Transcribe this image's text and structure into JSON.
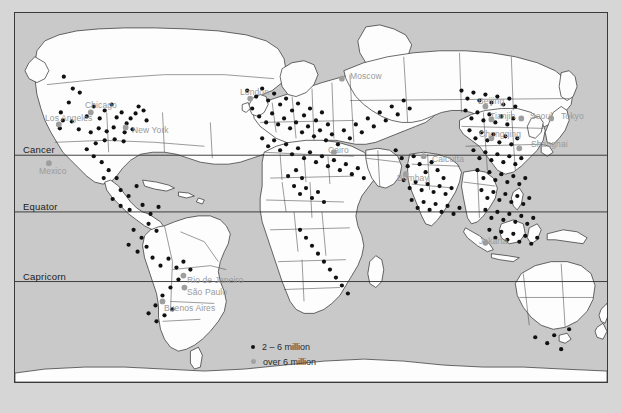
{
  "map": {
    "title": "World map of large cities",
    "background_color": "#c9c9c9",
    "land_color": "#fdfdfd",
    "border_color": "#2b2b2b",
    "page_color": "#d6d6d6"
  },
  "latitude_lines": [
    {
      "name": "cancer",
      "label": "Cancer",
      "y": 155
    },
    {
      "name": "equator",
      "label": "Equator",
      "y": 212
    },
    {
      "name": "capricorn",
      "label": "Capricorn",
      "y": 282
    }
  ],
  "legend": {
    "items": [
      {
        "name": "legend-2-6-million",
        "label": "2 – 6 million",
        "marker": "small-black-dot",
        "color": "#141414"
      },
      {
        "name": "legend-over-6-million",
        "label": "over 6 million",
        "marker": "large-gray-dot",
        "color": "#a2a2a2"
      }
    ]
  },
  "city_labels": [
    {
      "name": "los-angeles",
      "label": "Los Angeles",
      "x": 44,
      "y": 118
    },
    {
      "name": "chicago",
      "label": "Chicago",
      "x": 84,
      "y": 105
    },
    {
      "name": "new-york",
      "label": "New York",
      "x": 131,
      "y": 130
    },
    {
      "name": "mexico",
      "label": "Mexico",
      "x": 38,
      "y": 171
    },
    {
      "name": "rio-de-janeiro",
      "label": "Rio de Janeiro",
      "x": 186,
      "y": 280
    },
    {
      "name": "sao-paulo",
      "label": "São Paulo",
      "x": 186,
      "y": 292
    },
    {
      "name": "buenos-aires",
      "label": "Buenos Aires",
      "x": 163,
      "y": 308
    },
    {
      "name": "london",
      "label": "London",
      "x": 239,
      "y": 92
    },
    {
      "name": "moscow",
      "label": "Moscow",
      "x": 349,
      "y": 76
    },
    {
      "name": "cairo",
      "label": "Cairo",
      "x": 327,
      "y": 150
    },
    {
      "name": "bombay",
      "label": "Bombay",
      "x": 396,
      "y": 178
    },
    {
      "name": "calcutta",
      "label": "Calcutta",
      "x": 431,
      "y": 159
    },
    {
      "name": "beijing",
      "label": "Beijing",
      "x": 477,
      "y": 101
    },
    {
      "name": "tianjin",
      "label": "Tianjin",
      "x": 489,
      "y": 116
    },
    {
      "name": "seoul",
      "label": "Seoul",
      "x": 529,
      "y": 116
    },
    {
      "name": "tokyo",
      "label": "Tokyo",
      "x": 560,
      "y": 116
    },
    {
      "name": "chongqing",
      "label": "Chongqing",
      "x": 478,
      "y": 134
    },
    {
      "name": "shanghai",
      "label": "Shanghai",
      "x": 530,
      "y": 144
    },
    {
      "name": "jakarta",
      "label": "Jakarta",
      "x": 478,
      "y": 241
    }
  ],
  "city_dots": {
    "small": [
      [
        63,
        76
      ],
      [
        72,
        88
      ],
      [
        79,
        92
      ],
      [
        68,
        102
      ],
      [
        60,
        112
      ],
      [
        62,
        120
      ],
      [
        59,
        128
      ],
      [
        71,
        121
      ],
      [
        78,
        129
      ],
      [
        86,
        116
      ],
      [
        93,
        106
      ],
      [
        99,
        118
      ],
      [
        104,
        110
      ],
      [
        111,
        104
      ],
      [
        116,
        117
      ],
      [
        121,
        112
      ],
      [
        126,
        123
      ],
      [
        130,
        118
      ],
      [
        135,
        113
      ],
      [
        138,
        106
      ],
      [
        143,
        110
      ],
      [
        146,
        120
      ],
      [
        124,
        132
      ],
      [
        132,
        129
      ],
      [
        113,
        127
      ],
      [
        106,
        131
      ],
      [
        98,
        128
      ],
      [
        90,
        132
      ],
      [
        95,
        143
      ],
      [
        104,
        140
      ],
      [
        114,
        139
      ],
      [
        123,
        141
      ],
      [
        86,
        149
      ],
      [
        93,
        156
      ],
      [
        101,
        162
      ],
      [
        108,
        170
      ],
      [
        116,
        178
      ],
      [
        103,
        178
      ],
      [
        120,
        190
      ],
      [
        128,
        196
      ],
      [
        136,
        186
      ],
      [
        112,
        199
      ],
      [
        120,
        206
      ],
      [
        129,
        210
      ],
      [
        142,
        205
      ],
      [
        150,
        214
      ],
      [
        158,
        207
      ],
      [
        148,
        224
      ],
      [
        156,
        231
      ],
      [
        141,
        238
      ],
      [
        133,
        230
      ],
      [
        128,
        245
      ],
      [
        137,
        252
      ],
      [
        146,
        247
      ],
      [
        152,
        258
      ],
      [
        160,
        266
      ],
      [
        168,
        259
      ],
      [
        176,
        268
      ],
      [
        183,
        262
      ],
      [
        190,
        270
      ],
      [
        178,
        280
      ],
      [
        170,
        288
      ],
      [
        162,
        296
      ],
      [
        155,
        306
      ],
      [
        148,
        314
      ],
      [
        156,
        322
      ],
      [
        164,
        316
      ],
      [
        172,
        310
      ],
      [
        247,
        90
      ],
      [
        256,
        96
      ],
      [
        262,
        88
      ],
      [
        268,
        100
      ],
      [
        274,
        93
      ],
      [
        280,
        104
      ],
      [
        286,
        98
      ],
      [
        292,
        110
      ],
      [
        298,
        103
      ],
      [
        304,
        115
      ],
      [
        310,
        108
      ],
      [
        316,
        120
      ],
      [
        322,
        112
      ],
      [
        328,
        124
      ],
      [
        252,
        108
      ],
      [
        259,
        116
      ],
      [
        266,
        122
      ],
      [
        272,
        113
      ],
      [
        278,
        124
      ],
      [
        284,
        118
      ],
      [
        290,
        128
      ],
      [
        296,
        122
      ],
      [
        302,
        132
      ],
      [
        308,
        126
      ],
      [
        314,
        136
      ],
      [
        320,
        130
      ],
      [
        326,
        140
      ],
      [
        332,
        134
      ],
      [
        338,
        144
      ],
      [
        344,
        130
      ],
      [
        350,
        138
      ],
      [
        356,
        124
      ],
      [
        362,
        132
      ],
      [
        368,
        118
      ],
      [
        374,
        126
      ],
      [
        380,
        112
      ],
      [
        386,
        120
      ],
      [
        392,
        106
      ],
      [
        398,
        114
      ],
      [
        404,
        100
      ],
      [
        410,
        108
      ],
      [
        262,
        138
      ],
      [
        268,
        146
      ],
      [
        274,
        140
      ],
      [
        280,
        150
      ],
      [
        286,
        144
      ],
      [
        292,
        154
      ],
      [
        298,
        148
      ],
      [
        304,
        158
      ],
      [
        310,
        152
      ],
      [
        316,
        162
      ],
      [
        322,
        156
      ],
      [
        328,
        166
      ],
      [
        334,
        160
      ],
      [
        340,
        170
      ],
      [
        346,
        164
      ],
      [
        352,
        174
      ],
      [
        358,
        168
      ],
      [
        364,
        178
      ],
      [
        296,
        170
      ],
      [
        302,
        178
      ],
      [
        288,
        176
      ],
      [
        294,
        186
      ],
      [
        300,
        194
      ],
      [
        306,
        188
      ],
      [
        312,
        198
      ],
      [
        318,
        192
      ],
      [
        324,
        202
      ],
      [
        300,
        230
      ],
      [
        306,
        238
      ],
      [
        312,
        246
      ],
      [
        318,
        254
      ],
      [
        324,
        262
      ],
      [
        330,
        270
      ],
      [
        336,
        278
      ],
      [
        342,
        286
      ],
      [
        348,
        294
      ],
      [
        396,
        150
      ],
      [
        402,
        158
      ],
      [
        408,
        166
      ],
      [
        414,
        156
      ],
      [
        420,
        164
      ],
      [
        426,
        172
      ],
      [
        432,
        162
      ],
      [
        438,
        170
      ],
      [
        444,
        178
      ],
      [
        404,
        180
      ],
      [
        410,
        188
      ],
      [
        416,
        182
      ],
      [
        422,
        190
      ],
      [
        428,
        184
      ],
      [
        434,
        192
      ],
      [
        440,
        186
      ],
      [
        446,
        194
      ],
      [
        452,
        188
      ],
      [
        412,
        200
      ],
      [
        418,
        208
      ],
      [
        424,
        202
      ],
      [
        430,
        210
      ],
      [
        436,
        204
      ],
      [
        442,
        212
      ],
      [
        448,
        206
      ],
      [
        454,
        214
      ],
      [
        460,
        208
      ],
      [
        462,
        90
      ],
      [
        468,
        98
      ],
      [
        474,
        92
      ],
      [
        480,
        100
      ],
      [
        486,
        94
      ],
      [
        492,
        102
      ],
      [
        498,
        96
      ],
      [
        504,
        104
      ],
      [
        510,
        98
      ],
      [
        516,
        106
      ],
      [
        466,
        110
      ],
      [
        472,
        118
      ],
      [
        478,
        112
      ],
      [
        484,
        120
      ],
      [
        490,
        114
      ],
      [
        496,
        122
      ],
      [
        502,
        116
      ],
      [
        508,
        124
      ],
      [
        514,
        118
      ],
      [
        470,
        130
      ],
      [
        476,
        138
      ],
      [
        482,
        132
      ],
      [
        488,
        140
      ],
      [
        494,
        134
      ],
      [
        500,
        142
      ],
      [
        506,
        136
      ],
      [
        512,
        144
      ],
      [
        518,
        138
      ],
      [
        474,
        150
      ],
      [
        480,
        158
      ],
      [
        486,
        152
      ],
      [
        492,
        160
      ],
      [
        498,
        154
      ],
      [
        504,
        162
      ],
      [
        510,
        156
      ],
      [
        516,
        164
      ],
      [
        522,
        158
      ],
      [
        478,
        170
      ],
      [
        484,
        178
      ],
      [
        490,
        172
      ],
      [
        496,
        180
      ],
      [
        502,
        174
      ],
      [
        508,
        182
      ],
      [
        514,
        176
      ],
      [
        520,
        184
      ],
      [
        526,
        178
      ],
      [
        482,
        190
      ],
      [
        488,
        198
      ],
      [
        494,
        192
      ],
      [
        500,
        200
      ],
      [
        506,
        194
      ],
      [
        512,
        202
      ],
      [
        518,
        196
      ],
      [
        524,
        204
      ],
      [
        530,
        198
      ],
      [
        486,
        210
      ],
      [
        492,
        218
      ],
      [
        498,
        212
      ],
      [
        504,
        220
      ],
      [
        510,
        214
      ],
      [
        516,
        222
      ],
      [
        522,
        216
      ],
      [
        528,
        224
      ],
      [
        534,
        218
      ],
      [
        490,
        230
      ],
      [
        496,
        238
      ],
      [
        502,
        232
      ],
      [
        508,
        240
      ],
      [
        514,
        234
      ],
      [
        520,
        242
      ],
      [
        526,
        236
      ],
      [
        532,
        244
      ],
      [
        538,
        238
      ],
      [
        555,
        336
      ],
      [
        570,
        330
      ],
      [
        548,
        344
      ],
      [
        562,
        350
      ],
      [
        536,
        338
      ]
    ],
    "big": [
      [
        58,
        124
      ],
      [
        90,
        112
      ],
      [
        125,
        127
      ],
      [
        48,
        163
      ],
      [
        183,
        276
      ],
      [
        184,
        288
      ],
      [
        162,
        302
      ],
      [
        250,
        98
      ],
      [
        342,
        78
      ],
      [
        334,
        152
      ],
      [
        406,
        174
      ],
      [
        424,
        156
      ],
      [
        486,
        106
      ],
      [
        492,
        119
      ],
      [
        522,
        118
      ],
      [
        552,
        118
      ],
      [
        492,
        138
      ],
      [
        520,
        148
      ],
      [
        486,
        243
      ]
    ]
  }
}
